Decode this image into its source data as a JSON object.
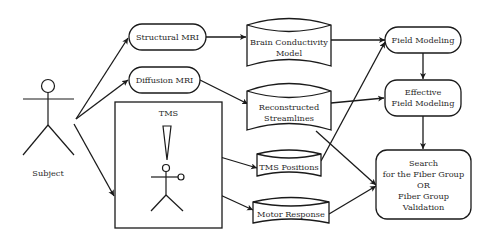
{
  "diagram": {
    "actor": {
      "label": "Subject"
    },
    "acquisition": {
      "structural_mri": "Structural MRI",
      "diffusion_mri": "Diffusion MRI",
      "tms_box_title": "TMS"
    },
    "data_stores": {
      "brain_model_line1": "Brain Conductivity",
      "brain_model_line2": "Model",
      "streamlines_line1": "Reconstructed",
      "streamlines_line2": "Streamlines",
      "tms_positions": "TMS Positions",
      "motor_response": "Motor Response"
    },
    "processes": {
      "field_modeling": "Field Modeling",
      "effective_line1": "Effective",
      "effective_line2": "Field Modeling",
      "search_line1": "Search",
      "search_line2": "for the Fiber Group",
      "search_line3": "OR",
      "search_line4": "Fiber Group",
      "search_line5": "Validation"
    },
    "edges": [
      {
        "from": "Subject",
        "to": "Structural MRI"
      },
      {
        "from": "Subject",
        "to": "Diffusion MRI"
      },
      {
        "from": "Subject",
        "to": "TMS"
      },
      {
        "from": "Structural MRI",
        "to": "Brain Conductivity Model"
      },
      {
        "from": "Diffusion MRI",
        "to": "Reconstructed Streamlines"
      },
      {
        "from": "TMS coil",
        "to": "TMS Positions"
      },
      {
        "from": "TMS subject",
        "to": "Motor Response"
      },
      {
        "from": "Brain Conductivity Model",
        "to": "Field Modeling"
      },
      {
        "from": "TMS Positions",
        "to": "Field Modeling"
      },
      {
        "from": "Reconstructed Streamlines",
        "to": "Effective Field Modeling"
      },
      {
        "from": "Field Modeling",
        "to": "Effective Field Modeling"
      },
      {
        "from": "Effective Field Modeling",
        "to": "Search for the Fiber Group OR Fiber Group Validation"
      },
      {
        "from": "Reconstructed Streamlines",
        "to": "Search for the Fiber Group OR Fiber Group Validation"
      },
      {
        "from": "Motor Response",
        "to": "Search for the Fiber Group OR Fiber Group Validation"
      }
    ]
  }
}
